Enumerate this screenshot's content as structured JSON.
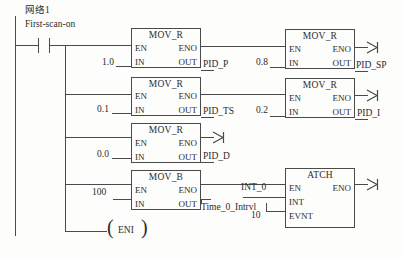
{
  "diagram": {
    "kind": "plc-ladder-logic",
    "network_label": "网络1",
    "contact": {
      "name": "First-scan-on",
      "type": "normally-open-contact"
    },
    "coil": {
      "name": "ENI",
      "type": "enable-interrupt-coil"
    },
    "blocks": [
      {
        "id": "mov-r-1",
        "title": "MOV_R",
        "pins_left": [
          "EN",
          "IN"
        ],
        "pins_right": [
          "ENO",
          "OUT"
        ],
        "input_value": "1.0",
        "output_label": "PID_P",
        "eno_arrow": false
      },
      {
        "id": "mov-r-2",
        "title": "MOV_R",
        "pins_left": [
          "EN",
          "IN"
        ],
        "pins_right": [
          "ENO",
          "OUT"
        ],
        "input_value": "0.1",
        "output_label": "PID_TS",
        "eno_arrow": false
      },
      {
        "id": "mov-r-3",
        "title": "MOV_R",
        "pins_left": [
          "EN",
          "IN"
        ],
        "pins_right": [
          "ENO",
          "OUT"
        ],
        "input_value": "0.0",
        "output_label": "PID_D",
        "eno_arrow": true
      },
      {
        "id": "mov-b-4",
        "title": "MOV_B",
        "pins_left": [
          "EN",
          "IN"
        ],
        "pins_right": [
          "ENO",
          "OUT"
        ],
        "input_value": "100",
        "output_label": "Time_0_Intrvl",
        "eno_arrow": false
      },
      {
        "id": "mov-r-5",
        "title": "MOV_R",
        "pins_left": [
          "EN",
          "IN"
        ],
        "pins_right": [
          "ENO",
          "OUT"
        ],
        "input_value": "0.8",
        "output_label": "PID_SP",
        "eno_arrow": true
      },
      {
        "id": "mov-r-6",
        "title": "MOV_R",
        "pins_left": [
          "EN",
          "IN"
        ],
        "pins_right": [
          "ENO",
          "OUT"
        ],
        "input_value": "0.2",
        "output_label": "PID_I",
        "eno_arrow": true
      },
      {
        "id": "atch-7",
        "title": "ATCH",
        "pins_left": [
          "EN",
          "INT",
          "EVNT"
        ],
        "pins_right": [
          "ENO"
        ],
        "int_value": "INT_0",
        "evnt_value": "10",
        "eno_arrow": true
      }
    ]
  },
  "colors": {
    "line": "#4a4a4a",
    "text": "#2b2b2b",
    "background": "#fdfdfc"
  }
}
